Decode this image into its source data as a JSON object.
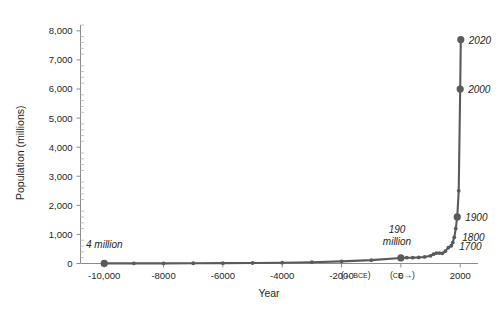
{
  "chart_data": {
    "type": "line",
    "title": "",
    "xlabel": "Year",
    "ylabel": "Population (millions)",
    "xlim": [
      -10800,
      2600
    ],
    "ylim": [
      0,
      8200
    ],
    "grid": false,
    "legend": "none",
    "y_ticks": [
      "0",
      "1,000",
      "2,000",
      "3,000",
      "4,000",
      "5,000",
      "6,000",
      "7,000",
      "8,000"
    ],
    "y_tick_values": [
      0,
      1000,
      2000,
      3000,
      4000,
      5000,
      6000,
      7000,
      8000
    ],
    "y_minor_interval": 200,
    "x_ticks": [
      "-10,000",
      "-8000",
      "-6000",
      "-4000",
      "-2000",
      "0",
      "2000"
    ],
    "x_tick_values": [
      -10000,
      -8000,
      -6000,
      -4000,
      -2000,
      0,
      2000
    ],
    "era_left_label": "(← BCE)",
    "era_left_paren_open": "(",
    "era_left_arrow": "←",
    "era_left_text": "BCE",
    "era_left_paren_close": ")",
    "era_right_paren_open": "(",
    "era_right_text": "CE",
    "era_right_arrow": "→",
    "era_right_paren_close": ")",
    "x": [
      -10000,
      -9000,
      -8000,
      -7000,
      -6000,
      -5000,
      -4000,
      -3000,
      -2000,
      -1000,
      0,
      200,
      400,
      600,
      800,
      1000,
      1100,
      1200,
      1300,
      1400,
      1500,
      1600,
      1700,
      1750,
      1800,
      1850,
      1900,
      1950,
      2000,
      2020
    ],
    "values": [
      4,
      5,
      6,
      8,
      12,
      18,
      28,
      45,
      72,
      115,
      190,
      200,
      200,
      210,
      225,
      265,
      320,
      360,
      360,
      350,
      425,
      545,
      610,
      720,
      900,
      1200,
      1600,
      2500,
      6000,
      7700
    ],
    "annotations": [
      {
        "id": "first-point",
        "text": "4 million",
        "x_value": -10000,
        "y_value": 4
      },
      {
        "id": "year-zero-point",
        "text_line1": "190",
        "text_line2": "million",
        "x_value": 0,
        "y_value": 190
      }
    ],
    "point_labels": [
      {
        "id": "label-2020",
        "text": "2020",
        "x_value": 2020,
        "y_value": 7700
      },
      {
        "id": "label-2000",
        "text": "2000",
        "x_value": 2000,
        "y_value": 6000
      },
      {
        "id": "label-1900",
        "text": "1900",
        "x_value": 1900,
        "y_value": 1600
      },
      {
        "id": "label-1800",
        "text": "1800",
        "x_value": 1800,
        "y_value": 900
      },
      {
        "id": "label-1700",
        "text": "1700",
        "x_value": 1700,
        "y_value": 610
      }
    ],
    "emphasized_points": [
      {
        "id": "point-10000bce",
        "x_value": -10000,
        "y_value": 4
      },
      {
        "id": "point-0ce",
        "x_value": 0,
        "y_value": 190
      },
      {
        "id": "point-1900",
        "x_value": 1900,
        "y_value": 1600
      },
      {
        "id": "point-2000",
        "x_value": 2000,
        "y_value": 6000
      },
      {
        "id": "point-2020",
        "x_value": 2020,
        "y_value": 7700
      }
    ],
    "colors": {
      "line": "#5a5a5a",
      "marker": "#5a5a5a",
      "axis": "#8c8c8c",
      "text": "#231f20",
      "background": "#ffffff"
    }
  }
}
